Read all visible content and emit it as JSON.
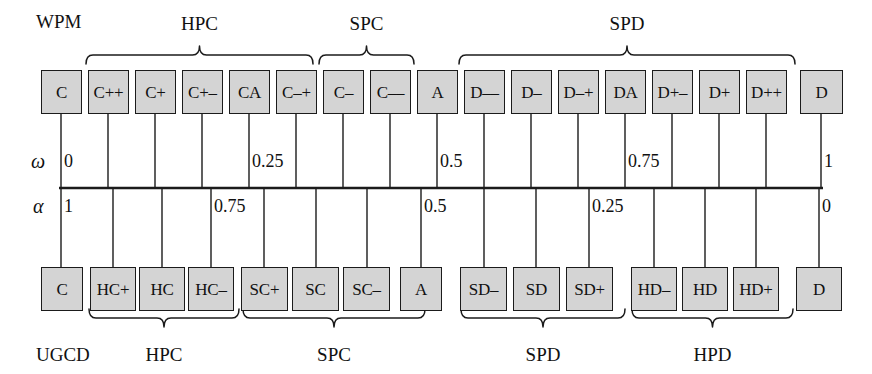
{
  "diagram": {
    "colors": {
      "box_fill": "#d4d4d4",
      "box_border": "#1b1b1b",
      "line": "#1b1b1b",
      "background": "#ffffff",
      "text": "#111111"
    },
    "row_labels": {
      "top_scale": "WPM",
      "bottom_scale": "UGCD",
      "omega": "ω",
      "alpha": "α"
    },
    "top_row": {
      "name": "WPM",
      "boxes": [
        {
          "label": "C",
          "x": 41,
          "w": 41
        },
        {
          "label": "C++",
          "x": 88,
          "w": 41
        },
        {
          "label": "C+",
          "x": 135,
          "w": 41
        },
        {
          "label": "C+–",
          "x": 182,
          "w": 41
        },
        {
          "label": "CA",
          "x": 229,
          "w": 41
        },
        {
          "label": "C–+",
          "x": 276,
          "w": 41
        },
        {
          "label": "C–",
          "x": 323,
          "w": 41
        },
        {
          "label": "C––",
          "x": 370,
          "w": 41
        },
        {
          "label": "A",
          "x": 417,
          "w": 41
        },
        {
          "label": "D––",
          "x": 464,
          "w": 41
        },
        {
          "label": "D–",
          "x": 511,
          "w": 41
        },
        {
          "label": "D–+",
          "x": 558,
          "w": 41
        },
        {
          "label": "DA",
          "x": 605,
          "w": 41
        },
        {
          "label": "D+–",
          "x": 652,
          "w": 41
        },
        {
          "label": "D+",
          "x": 699,
          "w": 41
        },
        {
          "label": "D++",
          "x": 746,
          "w": 41
        },
        {
          "label": "D",
          "x": 800,
          "w": 43
        }
      ],
      "braces": [
        {
          "label": "HPC",
          "x1": 86,
          "x2": 313
        },
        {
          "label": "SPC",
          "x1": 319,
          "x2": 414
        },
        {
          "label": "SPD",
          "x1": 459,
          "x2": 795
        }
      ]
    },
    "bottom_row": {
      "name": "UGCD",
      "boxes": [
        {
          "label": "C",
          "x": 41,
          "w": 42
        },
        {
          "label": "HC+",
          "x": 90,
          "w": 46
        },
        {
          "label": "HC",
          "x": 139,
          "w": 46
        },
        {
          "label": "HC–",
          "x": 188,
          "w": 46
        },
        {
          "label": "SC+",
          "x": 241,
          "w": 47
        },
        {
          "label": "SC",
          "x": 292,
          "w": 47
        },
        {
          "label": "SC–",
          "x": 343,
          "w": 47
        },
        {
          "label": "A",
          "x": 400,
          "w": 42
        },
        {
          "label": "SD–",
          "x": 460,
          "w": 47
        },
        {
          "label": "SD",
          "x": 513,
          "w": 47
        },
        {
          "label": "SD+",
          "x": 566,
          "w": 47
        },
        {
          "label": "HD–",
          "x": 631,
          "w": 46
        },
        {
          "label": "HD",
          "x": 682,
          "w": 46
        },
        {
          "label": "HD+",
          "x": 733,
          "w": 46
        },
        {
          "label": "D",
          "x": 796,
          "w": 46
        }
      ],
      "braces": [
        {
          "label": "HPC",
          "x1": 89,
          "x2": 239
        },
        {
          "label": "SPC",
          "x1": 243,
          "x2": 425
        },
        {
          "label": "SPD",
          "x1": 461,
          "x2": 625
        },
        {
          "label": "HPD",
          "x1": 632,
          "x2": 793
        }
      ]
    },
    "omega_scale": {
      "symbol": "ω",
      "ticks_x": [
        61,
        108,
        155,
        202,
        249,
        296,
        343,
        390,
        437,
        484,
        531,
        578,
        625,
        672,
        719,
        766,
        821
      ],
      "values": [
        {
          "text": "0",
          "x": 64,
          "tick_index": 0
        },
        {
          "text": "0.25",
          "x": 252,
          "tick_index": 4
        },
        {
          "text": "0.5",
          "x": 440,
          "tick_index": 8
        },
        {
          "text": "0.75",
          "x": 628,
          "tick_index": 12
        },
        {
          "text": "1",
          "x": 824,
          "tick_index": 16
        }
      ]
    },
    "alpha_scale": {
      "symbol": "α",
      "ticks_x": [
        61,
        113,
        162,
        211,
        264,
        316,
        367,
        421,
        484,
        536,
        589,
        654,
        705,
        756,
        819
      ],
      "values": [
        {
          "text": "1",
          "x": 64,
          "tick_index": 0
        },
        {
          "text": "0.75",
          "x": 214,
          "tick_index": 3
        },
        {
          "text": "0.5",
          "x": 424,
          "tick_index": 7
        },
        {
          "text": "0.25",
          "x": 592,
          "tick_index": 10
        },
        {
          "text": "0",
          "x": 822,
          "tick_index": 14
        }
      ]
    },
    "geometry": {
      "axis_y": 188,
      "axis_x1": 59,
      "axis_x2": 823,
      "top_box_y": 70,
      "top_box_h": 44,
      "bottom_box_y": 267,
      "bottom_box_h": 44,
      "top_brace_y": 55,
      "bottom_brace_y": 318
    }
  }
}
